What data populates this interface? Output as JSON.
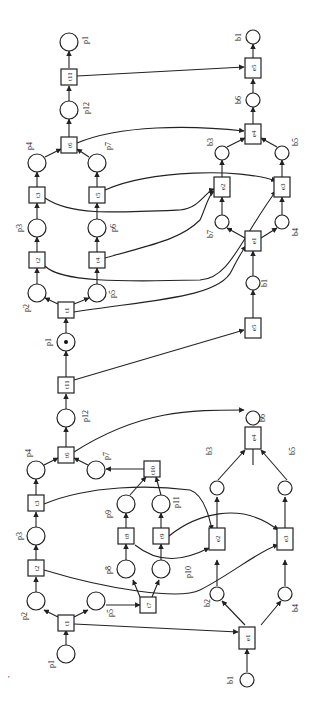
{
  "diagram": {
    "type": "petri-net",
    "orientation": "rotated-90",
    "stray_mark": "'",
    "upper_net": {
      "places": [
        "p1",
        "p12",
        "p4",
        "p7",
        "p3",
        "p6",
        "p2",
        "p5",
        "p1"
      ],
      "transitions": [
        "t11",
        "t6",
        "t3",
        "t5",
        "t2",
        "t4",
        "t1"
      ],
      "marked_place": "p1",
      "b_places": [
        "b1",
        "b6",
        "b3",
        "b5",
        "b7",
        "b4",
        "b1"
      ],
      "events": [
        "e5",
        "e4",
        "e2",
        "e3",
        "e1",
        "e5"
      ]
    },
    "lower_net": {
      "places": [
        "p12",
        "p4",
        "p7",
        "p3",
        "p9",
        "p11",
        "p8",
        "p10",
        "p2",
        "p5",
        "p1"
      ],
      "transitions": [
        "t11",
        "t6",
        "t3",
        "t10",
        "t8",
        "t9",
        "t2",
        "t7",
        "t1"
      ],
      "b_places": [
        "b6",
        "b3",
        "b5",
        "b2",
        "b4",
        "b1"
      ],
      "events": [
        "e4",
        "e2",
        "e3",
        "e1"
      ]
    },
    "labels": {
      "p1": "p1",
      "p2": "p2",
      "p3": "p3",
      "p4": "p4",
      "p5": "p5",
      "p6": "p6",
      "p7": "p7",
      "p8": "p8",
      "p9": "p9",
      "p10": "p10",
      "p11": "p11",
      "p12": "p12",
      "t1": "t1",
      "t2": "t2",
      "t3": "t3",
      "t4": "t4",
      "t5": "t5",
      "t6": "t6",
      "t7": "t7",
      "t8": "t8",
      "t9": "t9",
      "t10": "t10",
      "t11": "t11",
      "b1": "b1",
      "b2": "b2",
      "b3": "b3",
      "b4": "b4",
      "b5": "b5",
      "b6": "b6",
      "b7": "b7",
      "e1": "e1",
      "e2": "e2",
      "e3": "e3",
      "e4": "e4",
      "e5": "e5"
    }
  }
}
